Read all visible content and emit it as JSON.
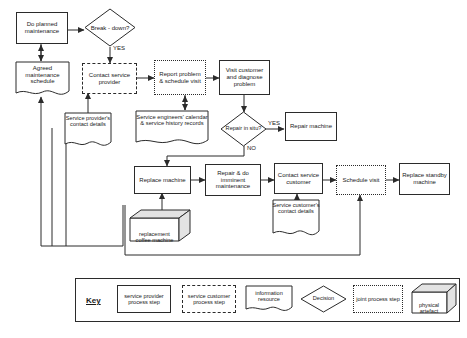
{
  "diagram": {
    "nodes": {
      "do_planned_maintenance": "Do planned maintenance",
      "breakdown": "Break - down?",
      "agreed_maintenance_schedule": "Agreed maintenance schedule",
      "contact_service_provider": "Contact service provider",
      "service_provider_contact_details": "Service provider's contact details",
      "report_problem_schedule_visit": "Report problem & schedule visit",
      "service_engineers_records": "Service engineers' calendar & service history records",
      "visit_customer_diagnose": "Visit customer and diagnose problem",
      "repair_in_situ": "Repair in situ?",
      "repair_machine": "Repair machine",
      "replace_machine": "Replace machine",
      "replacement_coffee_machine": "replacement coffee machine",
      "repair_do_imminent_maintenance": "Repair & do imminent maintenance",
      "contact_service_customer": "Contact service customer",
      "service_customer_contact_details": "Service customer's contact details",
      "schedule_visit": "Schedule visit",
      "replace_standby_machine": "Replace standby machine"
    },
    "edge_labels": {
      "breakdown_yes": "YES",
      "repair_in_situ_yes": "YES",
      "repair_in_situ_no": "NO"
    }
  },
  "key": {
    "title": "Key",
    "items": [
      {
        "id": "service-provider-process-step",
        "label": "service provider process step",
        "shape": "solid-rect"
      },
      {
        "id": "service-customer-process-step",
        "label": "service customer process step",
        "shape": "dashed-rect"
      },
      {
        "id": "information-resource",
        "label": "information resource",
        "shape": "document"
      },
      {
        "id": "decision",
        "label": "Decision",
        "shape": "diamond"
      },
      {
        "id": "joint-process-step",
        "label": "joint process step",
        "shape": "dotted-rect"
      },
      {
        "id": "physical-artefact",
        "label": "physical artefact",
        "shape": "cube"
      }
    ]
  },
  "colors": {
    "line": "#2b2b2b",
    "background": "#ffffff",
    "text": "#1a1a1a",
    "artefact_shade": "#e3e3e3"
  }
}
